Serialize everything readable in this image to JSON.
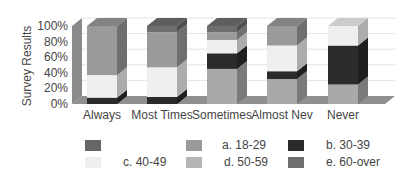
{
  "chart_data": {
    "type": "bar",
    "stacked": true,
    "style": "3d",
    "title": "",
    "xlabel": "",
    "ylabel": "Survey Results",
    "ylim": [
      0,
      100
    ],
    "yticks": [
      "0%",
      "20%",
      "40%",
      "60%",
      "80%",
      "100%"
    ],
    "categories": [
      "Always",
      "Most Times",
      "Sometimes",
      "Almost Nev",
      "Never"
    ],
    "series": [
      {
        "name": "d. 50-59",
        "color": "#a9a9a9",
        "values": [
          0,
          0,
          45,
          32,
          25
        ]
      },
      {
        "name": "b. 30-39",
        "color": "#2b2b2b",
        "values": [
          8,
          9,
          20,
          10,
          50
        ]
      },
      {
        "name": "c. 40-49",
        "color": "#efefef",
        "values": [
          29,
          38,
          17,
          33,
          25
        ]
      },
      {
        "name": "a. 18-29",
        "color": "#9a9a9a",
        "values": [
          63,
          45,
          10,
          25,
          0
        ]
      },
      {
        "name": "e. 60-over",
        "color": "#6e6e6e",
        "values": [
          0,
          8,
          8,
          0,
          0
        ]
      }
    ],
    "legend": {
      "placement": "bottom",
      "entries": [
        {
          "label": "",
          "color": "#666666"
        },
        {
          "label": "a.  18-29",
          "color": "#9a9a9a"
        },
        {
          "label": "b. 30-39",
          "color": "#2b2b2b"
        },
        {
          "label": "c. 40-49",
          "color": "#efefef"
        },
        {
          "label": "d. 50-59",
          "color": "#b5b5b5"
        },
        {
          "label": "e. 60-over",
          "color": "#6e6e6e"
        }
      ]
    },
    "grid": true,
    "wall_color": "#8a8a8a",
    "floor_color": "#8f8f8f"
  }
}
